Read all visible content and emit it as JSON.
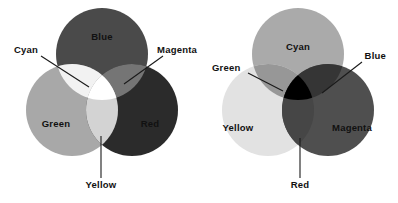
{
  "figure": {
    "title": "",
    "background_color": "#ffffff",
    "width": 398,
    "height": 203
  },
  "diagrams": [
    {
      "id": "additive",
      "name": "additive-color-diagram",
      "model": "RGB additive primaries",
      "center_region_color": "#ffffff",
      "circles": [
        {
          "label": "Blue",
          "name": "circle-blue",
          "cx": 102,
          "cy": 54,
          "r": 46,
          "gray_hex": "#4a4a4a"
        },
        {
          "label": "Green",
          "name": "circle-green",
          "cx": 72,
          "cy": 110,
          "r": 46,
          "gray_hex": "#a8a8a8"
        },
        {
          "label": "Red",
          "name": "circle-red",
          "cx": 132,
          "cy": 110,
          "r": 46,
          "gray_hex": "#2b2b2b"
        }
      ],
      "inner_labels": [
        {
          "text": "Blue",
          "name": "label-blue",
          "x": 102,
          "y": 40,
          "tone": "light"
        },
        {
          "text": "Green",
          "name": "label-green",
          "x": 56,
          "y": 127,
          "tone": "dark"
        },
        {
          "text": "Red",
          "name": "label-red",
          "x": 150,
          "y": 127,
          "tone": "light"
        }
      ],
      "callouts": [
        {
          "text": "Cyan",
          "name": "callout-cyan",
          "text_x": 14,
          "text_y": 53,
          "anchor": "start",
          "line": [
            [
              41,
              56
            ],
            [
              89,
              87
            ]
          ]
        },
        {
          "text": "Magenta",
          "name": "callout-magenta",
          "text_x": 197,
          "text_y": 53,
          "anchor": "end",
          "line": [
            [
              163,
              56
            ],
            [
              124,
              84
            ]
          ]
        },
        {
          "text": "Yellow",
          "name": "callout-yellow",
          "text_x": 101,
          "text_y": 188,
          "anchor": "middle",
          "line": [
            [
              101,
              178
            ],
            [
              101,
              136
            ]
          ]
        }
      ]
    },
    {
      "id": "subtractive",
      "name": "subtractive-color-diagram",
      "model": "CMY subtractive primaries",
      "center_region_color": "#000000",
      "circles": [
        {
          "label": "Cyan",
          "name": "circle-cyan",
          "cx": 298,
          "cy": 54,
          "r": 46,
          "gray_hex": "#aaaaaa"
        },
        {
          "label": "Yellow",
          "name": "circle-yellow",
          "cx": 268,
          "cy": 110,
          "r": 46,
          "gray_hex": "#e2e2e2"
        },
        {
          "label": "Magenta",
          "name": "circle-magenta",
          "cx": 328,
          "cy": 110,
          "r": 46,
          "gray_hex": "#4f4f4f"
        }
      ],
      "inner_labels": [
        {
          "text": "Cyan",
          "name": "label-cyan",
          "x": 298,
          "y": 50,
          "tone": "dark"
        },
        {
          "text": "Yellow",
          "name": "label-yellow",
          "x": 238,
          "y": 131,
          "tone": "dark"
        },
        {
          "text": "Magenta",
          "name": "label-magenta",
          "x": 352,
          "y": 131,
          "tone": "light"
        }
      ],
      "callouts": [
        {
          "text": "Green",
          "name": "callout-green",
          "text_x": 212,
          "text_y": 71,
          "anchor": "start",
          "line": [
            [
              248,
              73
            ],
            [
              283,
              91
            ]
          ]
        },
        {
          "text": "Blue",
          "name": "callout-blue",
          "text_x": 386,
          "text_y": 59,
          "anchor": "end",
          "line": [
            [
              362,
              62
            ],
            [
              322,
              93
            ]
          ]
        },
        {
          "text": "Red",
          "name": "callout-red",
          "text_x": 300,
          "text_y": 188,
          "anchor": "middle",
          "line": [
            [
              300,
              178
            ],
            [
              300,
              138
            ]
          ]
        }
      ]
    }
  ]
}
